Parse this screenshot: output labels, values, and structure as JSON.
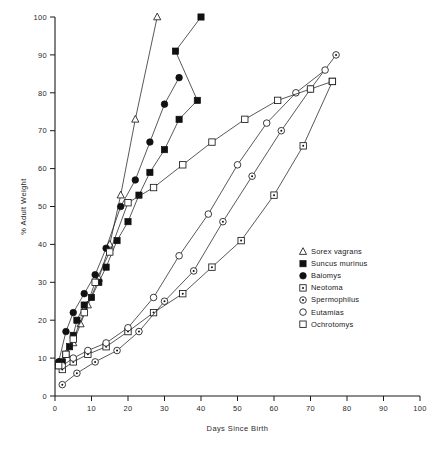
{
  "chart_data": {
    "type": "line",
    "title": "",
    "xlabel": "Days Since Birth",
    "ylabel": "% Adult Weight",
    "xlim": [
      0,
      100
    ],
    "ylim": [
      0,
      100
    ],
    "xticks": [
      0,
      10,
      20,
      30,
      40,
      50,
      60,
      70,
      80,
      90,
      100
    ],
    "xtick_labels": [
      "0",
      "10",
      "20",
      "30",
      "40",
      "50",
      "60",
      "70",
      "80",
      "90",
      "100"
    ],
    "yticks": [
      0,
      10,
      20,
      30,
      40,
      50,
      60,
      70,
      80,
      90,
      100
    ],
    "ytick_labels": [
      "0",
      "10",
      "20",
      "30",
      "40",
      "50",
      "60",
      "70",
      "80",
      "90",
      "100"
    ],
    "grid": false,
    "legend_position": "center-right",
    "series": [
      {
        "name": "Sorex vagrans",
        "marker": "open-triangle",
        "x": [
          1,
          3,
          5,
          7,
          9,
          12,
          15,
          18,
          22,
          28
        ],
        "y": [
          9,
          11,
          14,
          19,
          24,
          31,
          40,
          53,
          73,
          100
        ]
      },
      {
        "name": "Suncus murinus",
        "marker": "filled-square",
        "x": [
          1,
          2,
          3,
          4,
          5,
          6,
          8,
          10,
          12,
          14,
          17,
          20,
          23,
          26,
          30,
          34,
          39
        ],
        "y": [
          8,
          9,
          11,
          13,
          16,
          20,
          24,
          26,
          30,
          34,
          41,
          46,
          53,
          59,
          65,
          73,
          78
        ],
        "x2": [
          33,
          40
        ],
        "y2": [
          91,
          100
        ]
      },
      {
        "name": "Baiomys",
        "marker": "filled-circle",
        "x": [
          1,
          3,
          5,
          8,
          11,
          14,
          18,
          22,
          26,
          30
        ],
        "y": [
          9,
          17,
          22,
          27,
          32,
          39,
          50,
          57,
          67,
          77
        ],
        "x2": [
          34
        ],
        "y2": [
          84
        ]
      },
      {
        "name": "Neotoma",
        "marker": "dotted-square",
        "x": [
          2,
          5,
          9,
          14,
          20,
          27,
          35,
          43,
          51,
          60,
          68,
          76
        ],
        "y": [
          7,
          9,
          11,
          13,
          17,
          22,
          27,
          34,
          41,
          53,
          66,
          83
        ]
      },
      {
        "name": "Spermophilus",
        "marker": "dotted-circle",
        "x": [
          2,
          6,
          11,
          17,
          23,
          30,
          38,
          46,
          54,
          62,
          70,
          77
        ],
        "y": [
          3,
          6,
          9,
          12,
          17,
          25,
          33,
          46,
          58,
          70,
          81,
          90
        ]
      },
      {
        "name": "Eutamias",
        "marker": "open-circle",
        "x": [
          2,
          5,
          9,
          14,
          20,
          27,
          34,
          42,
          50,
          58,
          66,
          74
        ],
        "y": [
          8,
          10,
          12,
          14,
          18,
          26,
          37,
          48,
          61,
          72,
          80,
          86
        ]
      },
      {
        "name": "Ochrotomys",
        "marker": "open-square",
        "x": [
          1,
          3,
          5,
          8,
          11,
          15,
          20,
          27,
          35,
          43,
          52,
          61,
          70,
          76
        ],
        "y": [
          8,
          11,
          15,
          22,
          30,
          38,
          51,
          55,
          61,
          67,
          73,
          78,
          81,
          83
        ]
      }
    ]
  },
  "legend": {
    "items": [
      {
        "label": "Sorex vagrans",
        "marker": "open-triangle"
      },
      {
        "label": "Suncus murinus",
        "marker": "filled-square"
      },
      {
        "label": "Baiomys",
        "marker": "filled-circle"
      },
      {
        "label": "Neotoma",
        "marker": "dotted-square"
      },
      {
        "label": "Spermophilus",
        "marker": "dotted-circle"
      },
      {
        "label": "Eutamias",
        "marker": "open-circle"
      },
      {
        "label": "Ochrotomys",
        "marker": "open-square"
      }
    ]
  }
}
